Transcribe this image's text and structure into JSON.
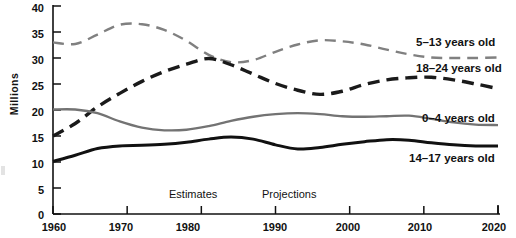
{
  "chart_data": {
    "type": "line",
    "title": "",
    "subtitle": "",
    "xlabel": "",
    "ylabel": "Millions",
    "xlim": [
      1960,
      2020
    ],
    "ylim": [
      0,
      40
    ],
    "grid": false,
    "legend_position": "right-inline",
    "y_ticks": [
      40,
      35,
      30,
      25,
      20,
      15,
      10,
      5,
      0
    ],
    "x_ticks": [
      1960,
      1970,
      1980,
      1990,
      2000,
      2010,
      2020
    ],
    "annotations": [
      {
        "text": "Estimates",
        "x": 1983,
        "y": 4.5
      },
      {
        "text": "Projections",
        "x": 1994,
        "y": 4.5
      }
    ],
    "series": [
      {
        "name": "5-13 years old",
        "label": "5–13 years old",
        "style": "dashed",
        "color": "#808080",
        "x": [
          1960,
          1963,
          1966,
          1969,
          1972,
          1975,
          1978,
          1981,
          1984,
          1987,
          1990,
          1993,
          1996,
          1999,
          2002,
          2005,
          2008,
          2011,
          2014,
          2017,
          2020
        ],
        "values": [
          33.0,
          32.7,
          34.5,
          36.4,
          36.5,
          35.4,
          33.3,
          30.6,
          29.2,
          29.6,
          31.2,
          32.6,
          33.4,
          33.2,
          32.6,
          31.6,
          30.7,
          30.1,
          30.0,
          30.0,
          30.1
        ]
      },
      {
        "name": "18-24 years old",
        "label": "18–24 years old",
        "style": "dashed-heavy",
        "color": "#1a1a1a",
        "x": [
          1960,
          1963,
          1966,
          1969,
          1972,
          1975,
          1978,
          1981,
          1984,
          1987,
          1990,
          1993,
          1996,
          1999,
          2002,
          2005,
          2008,
          2011,
          2014,
          2017,
          2020
        ],
        "values": [
          15.0,
          17.4,
          20.6,
          23.2,
          25.5,
          27.4,
          28.8,
          29.9,
          28.7,
          26.9,
          25.1,
          23.8,
          23.0,
          23.6,
          24.9,
          25.8,
          26.2,
          26.3,
          25.8,
          25.0,
          24.1
        ]
      },
      {
        "name": "0-4 years old",
        "label": "0–4 years old",
        "style": "solid",
        "color": "#737373",
        "x": [
          1960,
          1963,
          1966,
          1969,
          1972,
          1975,
          1978,
          1981,
          1984,
          1987,
          1990,
          1993,
          1996,
          1999,
          2002,
          2005,
          2008,
          2011,
          2014,
          2017,
          2020
        ],
        "values": [
          20.1,
          20.1,
          19.4,
          17.8,
          16.6,
          16.1,
          16.2,
          16.9,
          17.9,
          18.7,
          19.2,
          19.4,
          19.2,
          18.8,
          18.7,
          18.8,
          18.9,
          18.3,
          17.6,
          17.2,
          17.1
        ]
      },
      {
        "name": "14-17 years old",
        "label": "14–17 years old",
        "style": "solid-heavy",
        "color": "#111111",
        "x": [
          1960,
          1963,
          1966,
          1969,
          1972,
          1975,
          1978,
          1981,
          1984,
          1987,
          1990,
          1993,
          1996,
          1999,
          2002,
          2005,
          2008,
          2011,
          2014,
          2017,
          2020
        ],
        "values": [
          10.1,
          11.3,
          12.6,
          13.1,
          13.2,
          13.4,
          13.8,
          14.4,
          14.8,
          14.4,
          13.3,
          12.5,
          12.8,
          13.4,
          13.9,
          14.3,
          14.2,
          13.7,
          13.3,
          13.1,
          13.1
        ]
      }
    ]
  },
  "axis": {
    "y_title": "Millions",
    "y_labels": [
      "40",
      "35",
      "30",
      "25",
      "20",
      "15",
      "10",
      "5",
      "0"
    ],
    "x_labels": [
      "1960",
      "1970",
      "1980",
      "1990",
      "2000",
      "2010",
      "2020"
    ]
  },
  "annotations": {
    "estimates": "Estimates",
    "projections": "Projections"
  },
  "series_labels": {
    "s5_13": "5–13 years old",
    "s18_24": "18–24 years old",
    "s0_4": "0–4 years old",
    "s14_17": "14–17 years old"
  },
  "colors": {
    "axis": "#111111",
    "gray_series": "#808080",
    "dark_series": "#1a1a1a",
    "background": "#ffffff"
  }
}
